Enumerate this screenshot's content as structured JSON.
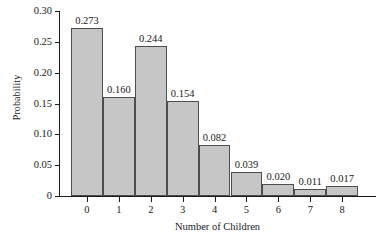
{
  "chart_data": {
    "type": "bar",
    "title": "",
    "subtitle": "",
    "xlabel": "Number of Children",
    "ylabel": "Probability",
    "categories": [
      "0",
      "1",
      "2",
      "3",
      "4",
      "5",
      "6",
      "7",
      "8"
    ],
    "values": [
      0.273,
      0.16,
      0.244,
      0.154,
      0.082,
      0.039,
      0.02,
      0.011,
      0.017
    ],
    "value_labels": [
      "0.273",
      "0.160",
      "0.244",
      "0.154",
      "0.082",
      "0.039",
      "0.020",
      "0.011",
      "0.017"
    ],
    "ylim": [
      0,
      0.3
    ],
    "ytick_values": [
      0,
      0.05,
      0.1,
      0.15,
      0.2,
      0.25,
      0.3
    ],
    "ytick_labels": [
      "0",
      "0.05",
      "0.10",
      "0.15",
      "0.20",
      "0.25",
      "0.30"
    ],
    "grid": false,
    "legend": null,
    "legend_position": "none",
    "bar_fill_color": "#c6c6c6",
    "bar_edge_color": "#4d4d4d",
    "axis_color": "#1a1a1a",
    "background_color": "#ffffff"
  }
}
